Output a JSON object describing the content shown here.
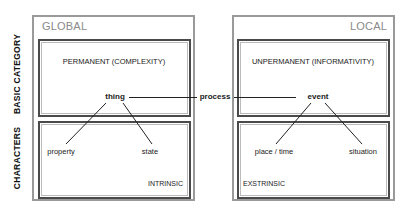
{
  "diagram": {
    "row_labels": {
      "basic_category": "BASIC CATEGORY",
      "characters": "CHARACTERS"
    },
    "left_panel": {
      "region": "GLOBAL",
      "category": "PERMANENT (COMPLEXITY)",
      "main_node": "thing",
      "children": [
        "property",
        "state"
      ],
      "character_type": "INTRINSIC"
    },
    "connector": {
      "label": "process"
    },
    "right_panel": {
      "region": "LOCAL",
      "category": "UNPERMANENT (INFORMATIVITY)",
      "main_node": "event",
      "children": [
        "place / time",
        "situation"
      ],
      "character_type": "EXSTRINSIC"
    },
    "colors": {
      "outer_border": "#9a9a9a",
      "inner_border": "#4a4a4a",
      "region_text": "#8a8a8a",
      "text": "#1a1a1a"
    }
  }
}
